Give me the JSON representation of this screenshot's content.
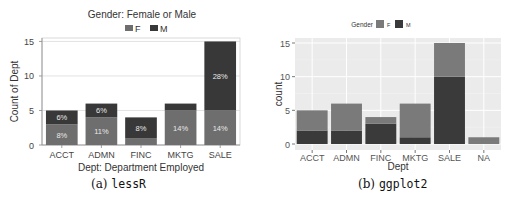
{
  "chart_data": [
    {
      "type": "bar",
      "stacked": true,
      "panel": "lessR",
      "title": "Gender: Female or Male",
      "xlabel": "Dept: Department Employed",
      "ylabel": "Count of Dept",
      "ylim": [
        0,
        15.5
      ],
      "yticks": [
        0,
        5,
        10,
        15
      ],
      "categories": [
        "ACCT",
        "ADMN",
        "FINC",
        "MKTG",
        "SALE"
      ],
      "legend": {
        "position": "top",
        "entries": [
          "F",
          "M"
        ]
      },
      "series": [
        {
          "name": "F",
          "values": [
            3,
            4,
            1,
            5,
            5
          ],
          "color": "#6e6e6e",
          "labels": [
            "8%",
            "11%",
            "",
            "14%",
            "14%"
          ]
        },
        {
          "name": "M",
          "values": [
            2,
            2,
            3,
            1,
            10
          ],
          "color": "#383838",
          "labels": [
            "6%",
            "6%",
            "8%",
            "",
            "28%"
          ]
        }
      ],
      "grid": true
    },
    {
      "type": "bar",
      "stacked": true,
      "panel": "ggplot2",
      "title": "",
      "xlabel": "Dept",
      "ylabel": "count",
      "ylim": [
        0,
        15.7
      ],
      "yticks": [
        0,
        5,
        10,
        15
      ],
      "categories": [
        "ACCT",
        "ADMN",
        "FINC",
        "MKTG",
        "SALE",
        "NA"
      ],
      "legend": {
        "position": "top",
        "title": "Gender",
        "entries": [
          "F",
          "M"
        ]
      },
      "series": [
        {
          "name": "F",
          "values": [
            3,
            4,
            1,
            5,
            5,
            1
          ],
          "color": "#7a7a7a"
        },
        {
          "name": "M",
          "values": [
            2,
            2,
            3,
            1,
            10,
            0
          ],
          "color": "#3a3a3a"
        }
      ],
      "grid": true
    }
  ],
  "captions": {
    "a_prefix": "(a)",
    "a_name": "lessR",
    "b_prefix": "(b)",
    "b_name": "ggplot2"
  }
}
